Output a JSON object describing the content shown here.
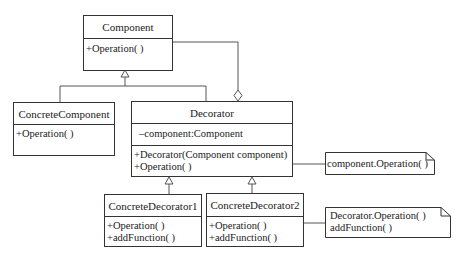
{
  "diagram": {
    "type": "UML class diagram - Decorator pattern",
    "classes": {
      "component": {
        "name": "Component",
        "attributes": [],
        "methods": [
          "+Operation( )"
        ]
      },
      "concrete_component": {
        "name": "ConcreteComponent",
        "attributes": [],
        "methods": [
          "+Operation( )"
        ]
      },
      "decorator": {
        "name": "Decorator",
        "attributes": [
          "–component:Component"
        ],
        "methods": [
          "+Decorator(Component component)",
          "+Operation( )"
        ]
      },
      "concrete_decorator1": {
        "name": "ConcreteDecorator1",
        "attributes": [],
        "methods": [
          "+Operation( )",
          "+addFunction( )"
        ]
      },
      "concrete_decorator2": {
        "name": "ConcreteDecorator2",
        "attributes": [],
        "methods": [
          "+Operation( )",
          "+addFunction( )"
        ]
      }
    },
    "notes": {
      "note1": {
        "lines": [
          "component.Operation( )"
        ]
      },
      "note2": {
        "lines": [
          "Decorator.Operation( )",
          "addFunction( )"
        ]
      }
    },
    "relationships": [
      {
        "from": "ConcreteComponent",
        "to": "Component",
        "kind": "generalization"
      },
      {
        "from": "Decorator",
        "to": "Component",
        "kind": "generalization"
      },
      {
        "from": "Decorator",
        "to": "Component",
        "kind": "aggregation"
      },
      {
        "from": "ConcreteDecorator1",
        "to": "Decorator",
        "kind": "generalization"
      },
      {
        "from": "ConcreteDecorator2",
        "to": "Decorator",
        "kind": "generalization"
      },
      {
        "from": "Decorator.Operation",
        "to": "note1",
        "kind": "note-link"
      },
      {
        "from": "ConcreteDecorator2.Operation",
        "to": "note2",
        "kind": "note-link"
      }
    ],
    "colors": {
      "line": "#333333",
      "background": "#ffffff",
      "text": "#222222"
    }
  }
}
